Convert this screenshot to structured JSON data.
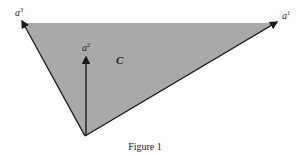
{
  "figure": {
    "caption": "Figure 1",
    "region_label": "C",
    "vectors": [
      {
        "name": "a",
        "index": "1"
      },
      {
        "name": "a",
        "index": "2"
      },
      {
        "name": "a",
        "index": "3"
      }
    ],
    "colors": {
      "fill": "#a9a9a9",
      "stroke": "#1a1a1a"
    }
  }
}
